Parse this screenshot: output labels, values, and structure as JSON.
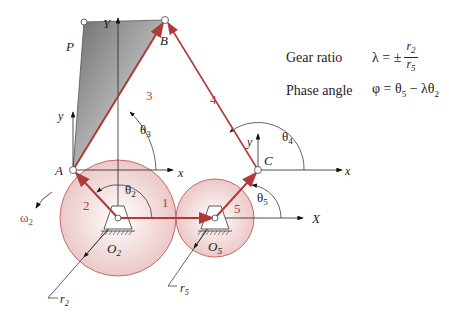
{
  "diagram": {
    "points": {
      "P": "P",
      "B": "B",
      "A": "A",
      "C": "C",
      "O2": "O",
      "O2_sub": "2",
      "O5": "O",
      "O5_sub": "5"
    },
    "axes": {
      "global_x": "X",
      "global_y": "Y",
      "local_x": "x",
      "local_y": "y"
    },
    "links": {
      "l1": "1",
      "l2": "2",
      "l3": "3",
      "l4": "4",
      "l5": "5"
    },
    "angles": {
      "theta": "θ",
      "t2": "2",
      "t3": "3",
      "t4": "4",
      "t5": "5",
      "omega": "ω",
      "omega_sub": "2"
    },
    "radii": {
      "r": "r",
      "r2_sub": "2",
      "r5_sub": "5"
    },
    "colors": {
      "link": "#b03a3a",
      "gear_fill": "#f1dada",
      "gear_stroke": "#c46a6a",
      "coupler": "#8a8a8a"
    }
  },
  "legend": {
    "gear_ratio_label": "Gear ratio",
    "gear_ratio_lhs": "λ = ±",
    "gear_ratio_num": "r",
    "gear_ratio_num_sub": "2",
    "gear_ratio_den": "r",
    "gear_ratio_den_sub": "5",
    "phase_angle_label": "Phase angle",
    "phase_angle_expr_1": "φ = θ",
    "phase_angle_expr_sub1": "5",
    "phase_angle_expr_2": " − λθ",
    "phase_angle_expr_sub2": "2"
  }
}
